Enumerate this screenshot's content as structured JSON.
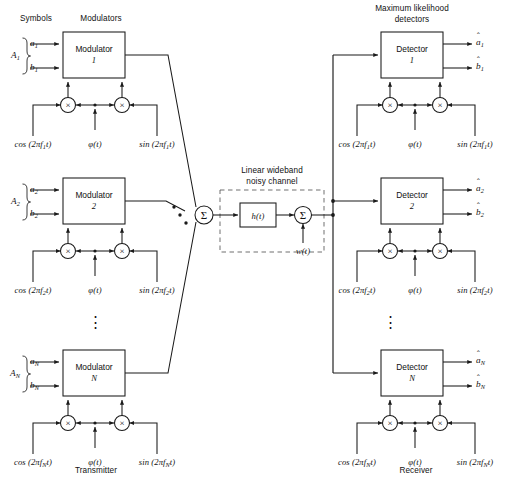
{
  "figure": {
    "type": "block-diagram",
    "domain": "digital-communications",
    "headings": {
      "symbols": "Symbols",
      "modulators": "Modulators",
      "detectors_line1": "Maximum likelihood",
      "detectors_line2": "detectors",
      "channel_line1": "Linear wideband",
      "channel_line2": "noisy channel",
      "transmitter": "Transmitter",
      "receiver": "Receiver"
    },
    "transmitter": {
      "branches": [
        {
          "group_label": "A",
          "group_sub": "1",
          "in_a": "a",
          "in_a_sub": "1",
          "in_b": "b",
          "in_b_sub": "1",
          "block_line1": "Modulator",
          "block_line2": "1",
          "cos_label": "cos (2πf",
          "cos_sub": "1",
          "cos_tail": "t)",
          "sin_label": "sin (2πf",
          "sin_sub": "1",
          "sin_tail": "t)",
          "phase_label": "φ(t)"
        },
        {
          "group_label": "A",
          "group_sub": "2",
          "in_a": "a",
          "in_a_sub": "2",
          "in_b": "b",
          "in_b_sub": "2",
          "block_line1": "Modulator",
          "block_line2": "2",
          "cos_label": "cos (2πf",
          "cos_sub": "2",
          "cos_tail": "t)",
          "sin_label": "sin (2πf",
          "sin_sub": "2",
          "sin_tail": "t)",
          "phase_label": "φ(t)"
        },
        {
          "group_label": "A",
          "group_sub": "N",
          "in_a": "a",
          "in_a_sub": "N",
          "in_b": "b",
          "in_b_sub": "N",
          "block_line1": "Modulator",
          "block_line2": "N",
          "cos_label": "cos (2πf",
          "cos_sub": "N",
          "cos_tail": "t)",
          "sin_label": "sin (2πf",
          "sin_sub": "N",
          "sin_tail": "t)",
          "phase_label": "φ(t)"
        }
      ],
      "multiplier_glyph": "×",
      "combiner_glyph": "Σ",
      "ellipsis_glyph": "⋮"
    },
    "channel": {
      "filter_label": "h(t)",
      "adder_glyph": "Σ",
      "noise_label": "w(t)"
    },
    "receiver": {
      "branches": [
        {
          "block_line1": "Detector",
          "block_line2": "1",
          "out_a": "a",
          "out_a_sub": "1",
          "out_b": "b",
          "out_b_sub": "1",
          "cos_label": "cos (2πf",
          "cos_sub": "1",
          "cos_tail": "t)",
          "sin_label": "sin (2πf",
          "sin_sub": "1",
          "sin_tail": "t)",
          "phase_label": "φ(t)"
        },
        {
          "block_line1": "Detector",
          "block_line2": "2",
          "out_a": "a",
          "out_a_sub": "2",
          "out_b": "b",
          "out_b_sub": "2",
          "cos_label": "cos (2πf",
          "cos_sub": "2",
          "cos_tail": "t)",
          "sin_label": "sin (2πf",
          "sin_sub": "2",
          "sin_tail": "t)",
          "phase_label": "φ(t)"
        },
        {
          "block_line1": "Detector",
          "block_line2": "N",
          "out_a": "a",
          "out_a_sub": "N",
          "out_b": "b",
          "out_b_sub": "N",
          "cos_label": "cos (2πf",
          "cos_sub": "N",
          "cos_tail": "t)",
          "sin_label": "sin (2πf",
          "sin_sub": "N",
          "sin_tail": "t)",
          "phase_label": "φ(t)"
        }
      ],
      "multiplier_glyph": "×",
      "hat_glyph": "ˆ",
      "ellipsis_glyph": "⋮"
    },
    "colors": {
      "ink": "#111111",
      "stroke": "#1a1a1a",
      "background": "#ffffff"
    }
  }
}
